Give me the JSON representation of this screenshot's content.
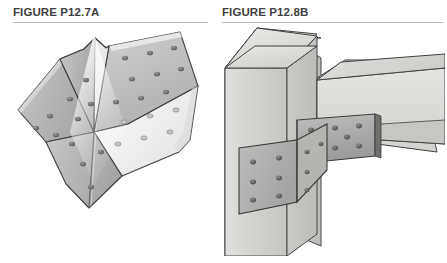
{
  "page": {
    "width": 447,
    "height": 263,
    "background": "#ffffff"
  },
  "figures": [
    {
      "id": "figure-p12-7a",
      "caption": "FIGURE P12.7A",
      "subject": "steel butterfly gusset connector plate, bent along a vertical fold, with rows of bolt holes",
      "rule_color": "#b9b9bc",
      "caption_color": "#3e3e41"
    },
    {
      "id": "figure-p12-8b",
      "caption": "FIGURE P12.8B",
      "subject": "timber column and beam connection with the steel connector plate bolted in place",
      "rule_color": "#b9b9bc",
      "caption_color": "#3e3e41"
    }
  ],
  "palette": {
    "steel_light": "#d8d8d6",
    "steel_mid": "#b6b6b4",
    "steel_dark": "#8f8f8e",
    "steel_edge": "#4a4a4a",
    "timber_light": "#dcdcda",
    "timber_mid": "#cfcfcc",
    "timber_shadow": "#c2c2bf",
    "outline": "#3f3f3f",
    "bolt": "#6f6f6e",
    "highlight": "#ffffff"
  },
  "figure_a_detail": {
    "fold_count": 1,
    "wing_count": 4,
    "bolt_hole_rows": "grid of round bolt holes across each wing",
    "bolt_hole_count_visible": 24
  },
  "figure_b_detail": {
    "members": [
      "column",
      "beam"
    ],
    "plates": [
      "beam-side plate",
      "column-side plate"
    ],
    "beam_plate_bolts": 8,
    "column_plate_bolts": 6,
    "column_face_bolts": 5
  }
}
